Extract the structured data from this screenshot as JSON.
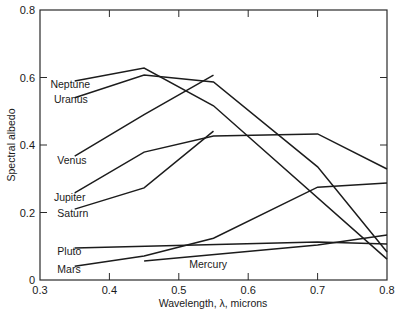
{
  "chart_data": {
    "type": "line",
    "title": "",
    "xlabel": "Wavelength, λ, microns",
    "ylabel": "Spectral albedo",
    "xlim": [
      0.3,
      0.8
    ],
    "ylim": [
      0,
      0.8
    ],
    "xticks": [
      0.3,
      0.4,
      0.5,
      0.6,
      0.7,
      0.8
    ],
    "xtick_labels": [
      "0.3",
      "0.4",
      "0.5",
      "0.6",
      "0.7",
      "0.8"
    ],
    "yticks": [
      0,
      0.2,
      0.4,
      0.6,
      0.8
    ],
    "ytick_labels": [
      "0",
      "0.2",
      "0.4",
      "0.6",
      "0.8"
    ],
    "grid": false,
    "legend": "inline labels",
    "series": [
      {
        "name": "Neptune",
        "x": [
          0.35,
          0.45,
          0.55,
          0.8
        ],
        "y": [
          0.59,
          0.628,
          0.516,
          0.062
        ],
        "label_pos": [
          0.315,
          0.57
        ]
      },
      {
        "name": "Uranus",
        "x": [
          0.35,
          0.45,
          0.55,
          0.7,
          0.8
        ],
        "y": [
          0.54,
          0.607,
          0.587,
          0.335,
          0.083
        ],
        "label_pos": [
          0.32,
          0.525
        ]
      },
      {
        "name": "Venus",
        "x": [
          0.35,
          0.45,
          0.55
        ],
        "y": [
          0.367,
          0.49,
          0.607
        ],
        "label_pos": [
          0.325,
          0.345
        ]
      },
      {
        "name": "Jupiter",
        "x": [
          0.35,
          0.45,
          0.55,
          0.7,
          0.8
        ],
        "y": [
          0.258,
          0.379,
          0.427,
          0.433,
          0.329
        ],
        "label_pos": [
          0.32,
          0.235
        ]
      },
      {
        "name": "Saturn",
        "x": [
          0.35,
          0.45,
          0.55
        ],
        "y": [
          0.21,
          0.273,
          0.441
        ],
        "label_pos": [
          0.325,
          0.188
        ]
      },
      {
        "name": "Pluto",
        "x": [
          0.35,
          0.7,
          0.8
        ],
        "y": [
          0.095,
          0.113,
          0.107
        ],
        "label_pos": [
          0.325,
          0.073
        ]
      },
      {
        "name": "Mars",
        "x": [
          0.35,
          0.45,
          0.55,
          0.7,
          0.8
        ],
        "y": [
          0.041,
          0.071,
          0.124,
          0.275,
          0.287
        ],
        "label_pos": [
          0.325,
          0.02
        ]
      },
      {
        "name": "Mercury",
        "x": [
          0.45,
          0.7,
          0.8
        ],
        "y": [
          0.056,
          0.104,
          0.133
        ],
        "label_pos": [
          0.515,
          0.035
        ]
      }
    ]
  },
  "ui": {
    "line_color": "#1c1c1c",
    "background": "#ffffff"
  }
}
